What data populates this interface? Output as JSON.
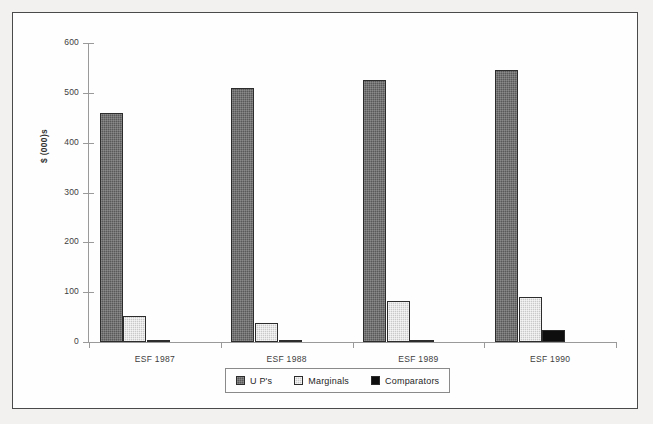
{
  "chart_data": {
    "type": "bar",
    "title": "",
    "subtitle": "",
    "xlabel": "",
    "ylabel": "$ (000)s",
    "categories": [
      "ESF 1987",
      "ESF 1988",
      "ESF 1989",
      "ESF 1990"
    ],
    "series": [
      {
        "name": "U P's",
        "values": [
          460,
          510,
          525,
          545
        ],
        "color": "#595959"
      },
      {
        "name": "Marginals",
        "values": [
          53,
          38,
          83,
          90
        ],
        "color": "#c9c9c9"
      },
      {
        "name": "Comparators",
        "values": [
          1,
          5,
          3,
          24
        ],
        "color": "#0e0e0e"
      }
    ],
    "ylim": [
      0,
      600
    ],
    "ytick_step": 100,
    "ytick_labels": [
      "600",
      "500",
      "400",
      "300",
      "200",
      "100",
      "0"
    ],
    "ytick_values": [
      600,
      500,
      400,
      300,
      200,
      100,
      0
    ],
    "grid": false,
    "legend_position": "bottom-center",
    "axis_color": "#9a9a9a",
    "frame_color": "#4a4a4a",
    "background": "#fefefe"
  },
  "legend": {
    "items": [
      {
        "label": "U P's",
        "swatch": "swatch-ups"
      },
      {
        "label": "Marginals",
        "swatch": "swatch-marginals"
      },
      {
        "label": "Comparators",
        "swatch": "swatch-comparators"
      }
    ]
  }
}
